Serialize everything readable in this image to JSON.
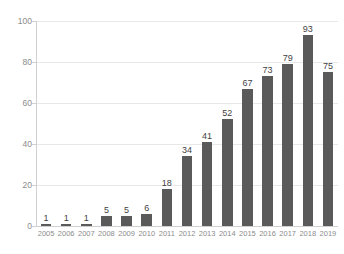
{
  "chart_data": {
    "type": "bar",
    "title": "",
    "subtitle": "",
    "xlabel": "",
    "ylabel": "",
    "categories": [
      "2005",
      "2006",
      "2007",
      "2008",
      "2009",
      "2010",
      "2011",
      "2012",
      "2013",
      "2014",
      "2015",
      "2016",
      "2017",
      "2018",
      "2019"
    ],
    "values": [
      1,
      1,
      1,
      5,
      5,
      6,
      18,
      34,
      41,
      52,
      67,
      73,
      79,
      93,
      75
    ],
    "series": [
      {
        "name": "",
        "values": [
          1,
          1,
          1,
          5,
          5,
          6,
          18,
          34,
          41,
          52,
          67,
          73,
          79,
          93,
          75
        ]
      }
    ],
    "ylim": [
      0,
      100
    ],
    "yticks": [
      0,
      20,
      40,
      60,
      80,
      100
    ],
    "ytick_labels": [
      "0",
      "20",
      "40",
      "60",
      "80",
      "100"
    ],
    "xlim_categories": 15,
    "grid": true,
    "grid_axis": "y",
    "legend": false,
    "legend_position": "none",
    "data_labels": true,
    "bar_color": "#5A5A5A",
    "gridline_color": "#E8E8E8",
    "axis_color": "#D0D0D0",
    "label_color": "#8C8C8C",
    "value_label_color": "#3F3F3F",
    "background_color": "#FFFFFF"
  },
  "axes": {
    "y_labels": [
      "100",
      "80",
      "60",
      "40",
      "20",
      "0"
    ],
    "x_labels": [
      "2005",
      "2006",
      "2007",
      "2008",
      "2009",
      "2010",
      "2011",
      "2012",
      "2013",
      "2014",
      "2015",
      "2016",
      "2017",
      "2018",
      "2019"
    ]
  },
  "bar_labels": [
    "1",
    "1",
    "1",
    "5",
    "5",
    "6",
    "18",
    "34",
    "41",
    "52",
    "67",
    "73",
    "79",
    "93",
    "75"
  ]
}
